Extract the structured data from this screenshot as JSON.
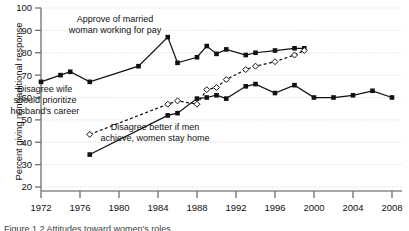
{
  "figure": {
    "ylabel": "Percent giving nontraditional response",
    "caption": "Figure 1.2  Attitudes toward women's roles"
  },
  "chart_data": {
    "type": "line",
    "title": "",
    "xlabel": "",
    "ylabel": "Percent giving nontraditional response",
    "xlim": [
      1971,
      2009
    ],
    "ylim": [
      20,
      100
    ],
    "ytick_labels": [
      "20",
      "30",
      "40",
      "50",
      "60",
      "70",
      "80",
      "90",
      "100"
    ],
    "yticks": [
      20,
      30,
      40,
      50,
      60,
      70,
      80,
      90,
      100
    ],
    "xtick_labels": [
      "1972",
      "1976",
      "1980",
      "1984",
      "1988",
      "1992",
      "1996",
      "2000",
      "2004",
      "2008"
    ],
    "xticks": [
      1972,
      1976,
      1980,
      1984,
      1988,
      1992,
      1996,
      2000,
      2004,
      2008
    ],
    "grid": "horizontal-dotted",
    "legend": "inline-annotations",
    "series": [
      {
        "name": "Approve of married woman working for pay",
        "marker": "filled-square",
        "line": "solid",
        "x": [
          1972,
          1974,
          1975,
          1977,
          1982,
          1985,
          1986,
          1988,
          1989,
          1990,
          1991,
          1993,
          1994,
          1996,
          1998,
          1999
        ],
        "values": [
          67,
          70,
          71.5,
          67,
          74,
          87,
          75.5,
          78,
          83,
          79.5,
          81.5,
          79,
          80,
          81,
          82,
          82
        ]
      },
      {
        "name": "Disagree wife should prioritize husband's career",
        "marker": "open-diamond",
        "line": "dashed",
        "x": [
          1977,
          1985,
          1986,
          1988,
          1989,
          1990,
          1991,
          1993,
          1994,
          1996,
          1998,
          1999
        ],
        "values": [
          43.5,
          57,
          58.5,
          57,
          63.5,
          64.5,
          68,
          72.5,
          74,
          76,
          79,
          81
        ]
      },
      {
        "name": "Disagree better if men achieve, women stay home",
        "marker": "filled-square",
        "line": "solid",
        "x": [
          1977,
          1985,
          1986,
          1988,
          1989,
          1990,
          1991,
          1993,
          1994,
          1996,
          1998,
          2000,
          2002,
          2004,
          2006,
          2008
        ],
        "values": [
          34.5,
          52,
          53,
          59.5,
          60,
          61,
          59.5,
          65,
          66,
          62,
          65.5,
          60,
          60,
          61,
          63,
          60
        ]
      }
    ],
    "annotations": [
      {
        "id": "annot-approve",
        "lines": [
          "Approve of married",
          "woman working for pay"
        ],
        "x": 115,
        "y": 22
      },
      {
        "id": "annot-disagree-wife",
        "lines": [
          "Disagree wife",
          "should prioritize",
          "husband's career"
        ],
        "x": 45,
        "y": 92
      },
      {
        "id": "annot-disagree-better",
        "lines": [
          "Disagree better if men",
          "achieve, women stay home"
        ],
        "x": 155,
        "y": 130
      }
    ]
  }
}
